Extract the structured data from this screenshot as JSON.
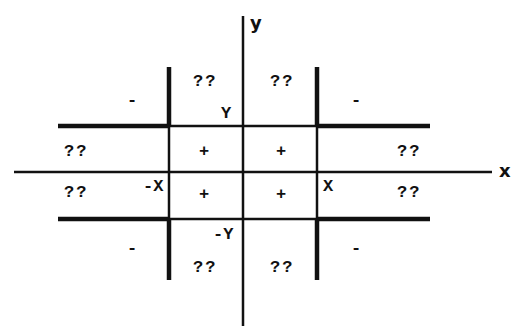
{
  "diagram": {
    "axes": {
      "x_label": "x",
      "y_label": "y"
    },
    "bounds": {
      "pos_x": "X",
      "neg_x": "-X",
      "pos_y": "Y",
      "neg_y": "-Y"
    },
    "regions": {
      "top_left_corner": "-",
      "top_right_corner": "-",
      "bottom_left_corner": "-",
      "bottom_right_corner": "-",
      "top_band_left": "??",
      "top_band_right": "??",
      "bottom_band_left": "??",
      "bottom_band_right": "??",
      "left_band_upper": "??",
      "left_band_lower": "??",
      "right_band_upper": "??",
      "right_band_lower": "??",
      "center_ul": "+",
      "center_ur": "+",
      "center_ll": "+",
      "center_lr": "+"
    },
    "colors": {
      "line": "#111111",
      "background": "#ffffff"
    }
  }
}
